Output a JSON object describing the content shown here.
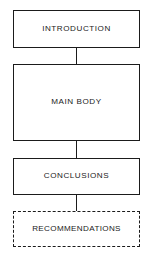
{
  "diagram": {
    "background_color": "#ffffff",
    "line_color": "#1b1b1b",
    "text_color": "#222222",
    "nodes": [
      {
        "id": "introduction",
        "label": "INTRODUCTION",
        "border_style": "solid",
        "x": 13,
        "y": 10,
        "width": 127,
        "height": 38
      },
      {
        "id": "main-body",
        "label": "MAIN BODY",
        "border_style": "solid",
        "x": 13,
        "y": 64,
        "width": 127,
        "height": 77
      },
      {
        "id": "conclusions",
        "label": "CONCLUSIONS",
        "border_style": "solid",
        "x": 13,
        "y": 158,
        "width": 127,
        "height": 37
      },
      {
        "id": "recommendations",
        "label": "RECOMMENDATIONS",
        "border_style": "dashed",
        "x": 13,
        "y": 211,
        "width": 127,
        "height": 36
      }
    ],
    "connectors": [
      {
        "id": "introduction-to-main-body",
        "x": 75.5,
        "y": 48,
        "height": 16
      },
      {
        "id": "main-body-to-conclusions",
        "x": 75.5,
        "y": 141,
        "height": 17
      },
      {
        "id": "conclusions-to-recommendations",
        "x": 75.5,
        "y": 195,
        "height": 16
      }
    ]
  }
}
